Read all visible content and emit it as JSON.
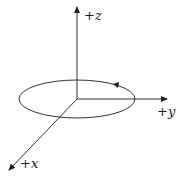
{
  "diagram": {
    "axes": {
      "z": {
        "sign": "+",
        "name": "z"
      },
      "y": {
        "sign": "+",
        "name": "y"
      },
      "x": {
        "sign": "+",
        "name": "x"
      }
    },
    "loop": {
      "shape": "ellipse",
      "direction-arrow": "counterclockwise (viewed from +z)"
    },
    "colors": {
      "stroke": "#333333",
      "background": "#ffffff"
    }
  }
}
